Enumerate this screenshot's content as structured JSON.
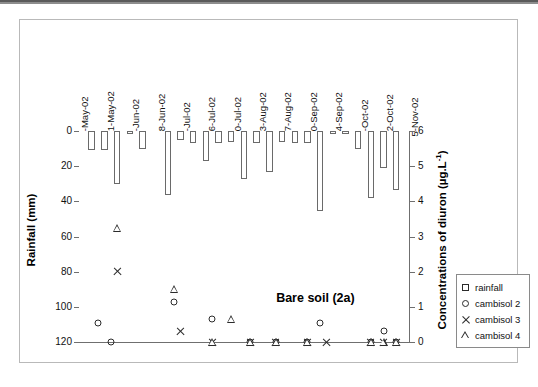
{
  "figure": {
    "annotation": "Bare soil (2a)"
  },
  "legend": {
    "items": [
      {
        "marker": "square-icon",
        "label": "rainfall"
      },
      {
        "marker": "circle-icon",
        "label": "cambisol 2"
      },
      {
        "marker": "cross-icon",
        "label": "cambisol 3"
      },
      {
        "marker": "triangle-icon",
        "label": "cambisol 4"
      }
    ]
  },
  "chart_data": {
    "type": "bar",
    "title": "Bare soil (2a)",
    "xlabel": "",
    "grid": false,
    "legend_position": "right-outside",
    "annotations": [
      "Bare soil (2a)"
    ],
    "x_tick_labels": [
      "7-May-02",
      "21-May-02",
      "4-Jun-02",
      "18-Jun-02",
      "2-Jul-02",
      "16-Jul-02",
      "30-Jul-02",
      "13-Aug-02",
      "27-Aug-02",
      "10-Sep-02",
      "24-Sep-02",
      "8-Oct-02",
      "22-Oct-02",
      "5-Nov-02"
    ],
    "axes": {
      "left": {
        "label": "Rainfall (mm)",
        "ticks": [
          0,
          20,
          40,
          60,
          80,
          100,
          120
        ],
        "lim": [
          0,
          120
        ],
        "inverted": true,
        "units": "mm"
      },
      "right": {
        "label": "Concentrations of diuron (µg.L-1)",
        "label_html": "Concentrations of diuron (µg.L<sup>-1</sup>)",
        "ticks": [
          0,
          1,
          2,
          3,
          4,
          5,
          6
        ],
        "lim": [
          0,
          6
        ],
        "inverted": false,
        "units": "µg.L-1"
      }
    },
    "series": [
      {
        "name": "rainfall",
        "type": "bar",
        "axis": "left",
        "unit": "mm",
        "values": [
          {
            "x": 2,
            "y": 11
          },
          {
            "x": 4,
            "y": 11
          },
          {
            "x": 6,
            "y": 30
          },
          {
            "x": 8,
            "y": 1.5
          },
          {
            "x": 10,
            "y": 10
          },
          {
            "x": 14,
            "y": 36.5
          },
          {
            "x": 16,
            "y": 5
          },
          {
            "x": 18,
            "y": 7
          },
          {
            "x": 20,
            "y": 17
          },
          {
            "x": 22,
            "y": 7
          },
          {
            "x": 24,
            "y": 6
          },
          {
            "x": 26,
            "y": 27.5
          },
          {
            "x": 28,
            "y": 7
          },
          {
            "x": 30,
            "y": 23.5
          },
          {
            "x": 32,
            "y": 6.5
          },
          {
            "x": 34,
            "y": 7
          },
          {
            "x": 36,
            "y": 7
          },
          {
            "x": 38,
            "y": 45.5
          },
          {
            "x": 40,
            "y": 1.5
          },
          {
            "x": 42,
            "y": 1.5
          },
          {
            "x": 44,
            "y": 10
          },
          {
            "x": 46,
            "y": 38
          },
          {
            "x": 48,
            "y": 21
          },
          {
            "x": 50,
            "y": 33.5
          }
        ]
      },
      {
        "name": "cambisol 2",
        "type": "scatter",
        "marker": "circle",
        "axis": "right",
        "unit": "µg.L-1",
        "values": [
          {
            "x": 3,
            "y": 0.55
          },
          {
            "x": 5,
            "y": 0.0
          },
          {
            "x": 15,
            "y": 1.15
          },
          {
            "x": 21,
            "y": 0.65
          },
          {
            "x": 27,
            "y": 0.0
          },
          {
            "x": 31,
            "y": 0.0
          },
          {
            "x": 36,
            "y": 0.0
          },
          {
            "x": 38,
            "y": 0.55
          },
          {
            "x": 46,
            "y": 0.0
          },
          {
            "x": 48,
            "y": 0.3
          },
          {
            "x": 50,
            "y": 0.0
          }
        ]
      },
      {
        "name": "cambisol 3",
        "type": "scatter",
        "marker": "cross",
        "axis": "right",
        "unit": "µg.L-1",
        "values": [
          {
            "x": 6,
            "y": 2.0
          },
          {
            "x": 16,
            "y": 0.3
          },
          {
            "x": 21,
            "y": 0.0
          },
          {
            "x": 27,
            "y": 0.0
          },
          {
            "x": 31,
            "y": 0.0
          },
          {
            "x": 36,
            "y": 0.0
          },
          {
            "x": 39,
            "y": 0.0
          },
          {
            "x": 46,
            "y": 0.0
          },
          {
            "x": 48,
            "y": 0.0
          },
          {
            "x": 50,
            "y": 0.0
          }
        ]
      },
      {
        "name": "cambisol 4",
        "type": "scatter",
        "marker": "triangle",
        "axis": "right",
        "unit": "µg.L-1",
        "values": [
          {
            "x": 6,
            "y": 3.25
          },
          {
            "x": 15,
            "y": 1.5
          },
          {
            "x": 21,
            "y": 0.0
          },
          {
            "x": 24,
            "y": 0.65
          },
          {
            "x": 27,
            "y": 0.0
          },
          {
            "x": 31,
            "y": 0.0
          },
          {
            "x": 36,
            "y": 0.0
          },
          {
            "x": 46,
            "y": 0.0
          },
          {
            "x": 48,
            "y": 0.0
          },
          {
            "x": 50,
            "y": 0.0
          }
        ]
      }
    ]
  }
}
